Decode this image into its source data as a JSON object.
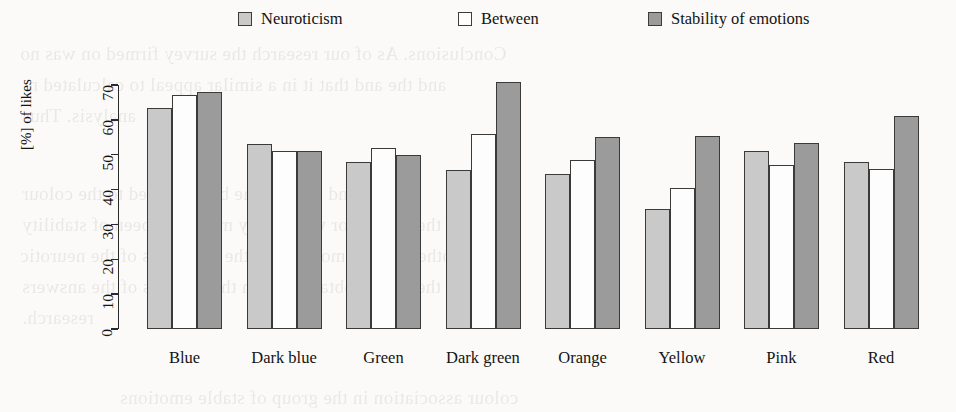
{
  "chart_data": {
    "type": "bar",
    "title": "",
    "subtitle": "",
    "xlabel": "",
    "ylabel": "[%] of likes",
    "ylim": [
      0,
      70
    ],
    "yticks": [
      0,
      10,
      20,
      30,
      40,
      50,
      60,
      70
    ],
    "grid": false,
    "legend_position": "top",
    "categories": [
      "Blue",
      "Dark blue",
      "Green",
      "Dark green",
      "Orange",
      "Yellow",
      "Pink",
      "Red"
    ],
    "series": [
      {
        "name": "Neuroticism",
        "color": "#c9c9c9",
        "values": [
          63.5,
          53.0,
          47.8,
          45.5,
          44.5,
          34.5,
          51.0,
          48.0
        ]
      },
      {
        "name": "Between",
        "color": "#fdfdfd",
        "values": [
          67.0,
          51.0,
          52.0,
          56.0,
          48.5,
          40.5,
          47.0,
          46.0
        ]
      },
      {
        "name": "Stability of emotions",
        "color": "#9b9b9b",
        "values": [
          68.0,
          51.0,
          50.0,
          71.0,
          55.0,
          55.5,
          53.5,
          61.0
        ]
      }
    ]
  },
  "legend": {
    "items": [
      {
        "label": "Neuroticism",
        "swatch_color": "#c9c9c9",
        "x": 238
      },
      {
        "label": "Between",
        "swatch_color": "#fdfdfd",
        "x": 458
      },
      {
        "label": "Stability of emotions",
        "swatch_color": "#9b9b9b",
        "x": 648
      }
    ]
  },
  "axes": {
    "y_axis_label": "[%] of likes",
    "y_tick_labels": [
      "0",
      "10",
      "20",
      "30",
      "40",
      "50",
      "60",
      "70"
    ],
    "x_tick_labels": [
      "Blue",
      "Dark blue",
      "Green",
      "Dark green",
      "Orange",
      "Yellow",
      "Pink",
      "Red"
    ]
  },
  "bleed_through_lines": [
    {
      "text": "Conclusions.  As of our research the survey firmed on was no",
      "x": 20,
      "y": 38
    },
    {
      "text": "and the and  that  it  in  a similar  appeal  to  calculated  n",
      "x": 28,
      "y": 69
    },
    {
      "text": "analysis.  Thus",
      "x": 22,
      "y": 100
    },
    {
      "text": "In one hand interest the be  attributed to  the  colour",
      "x": 22,
      "y": 178
    },
    {
      "text": "the  reason  for  which  they  may  have  been  of  stability",
      "x": 22,
      "y": 209
    },
    {
      "text": "other  of the  emotional  in  the  responses  of  the  neurotic",
      "x": 20,
      "y": 240
    },
    {
      "text": "the  results  obtained  from  the  analysis  of  the  answers",
      "x": 22,
      "y": 271
    },
    {
      "text": "research.",
      "x": 22,
      "y": 302
    },
    {
      "text": "colour  association  in  the  group  of  stable  emotions",
      "x": 120,
      "y": 382
    }
  ]
}
